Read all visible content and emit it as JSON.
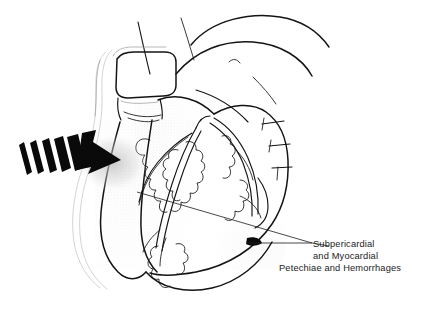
{
  "figure": {
    "background_color": "#ffffff",
    "ink_color": "#141414",
    "width": 428,
    "height": 313
  },
  "annotation": {
    "label_lines": [
      "Subpericardial",
      "and Myocardial",
      "Petechiae and Hemorrhages"
    ],
    "line_1": "Subpericardial",
    "line_2": "and Myocardial",
    "line_3": "Petechiae and Hemorrhages",
    "text_color": "#1c1c1c",
    "leader_count": 2
  },
  "impact_arrow": {
    "name": "blunt-force-impact-arrow",
    "direction": "left-to-right",
    "color": "#0a0a0a",
    "tail_stripe_count": 5,
    "points_to": "left ventricular free wall"
  },
  "anatomy": {
    "great_vessels": [
      "aortic arch",
      "pulmonary trunk",
      "superior vena cava",
      "brachiocephalic vessel"
    ],
    "chambers": [
      "left ventricle",
      "right ventricle",
      "right atrium",
      "right atrial appendage"
    ],
    "vessels": [
      "left anterior descending coronary artery",
      "diagonal branch",
      "right coronary artery",
      "marginal branch"
    ],
    "vessel_stub_count": 3,
    "features": [
      "epicardial fat pads",
      "pericardial reflection",
      "stippled hemorrhage shading"
    ]
  },
  "lesions": {
    "name": "petechiae-and-hemorrhage-stippling",
    "regions": [
      "anterior left ventricular wall",
      "inferior right ventricular border"
    ],
    "appearance": "graded stipple"
  }
}
